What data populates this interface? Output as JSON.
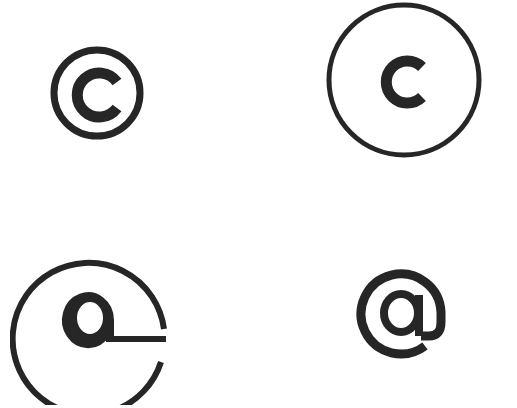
{
  "symbols": [
    {
      "id": "copyright-small",
      "label": "©",
      "letter": "c"
    },
    {
      "id": "copyright-large",
      "label": "c in circle",
      "letter": "c"
    },
    {
      "id": "at-open-circle",
      "label": "a in open circle",
      "letter": "a"
    },
    {
      "id": "at-sign",
      "label": "@",
      "letter": "@"
    }
  ],
  "colors": {
    "stroke": "#262626",
    "background": "#ffffff"
  }
}
